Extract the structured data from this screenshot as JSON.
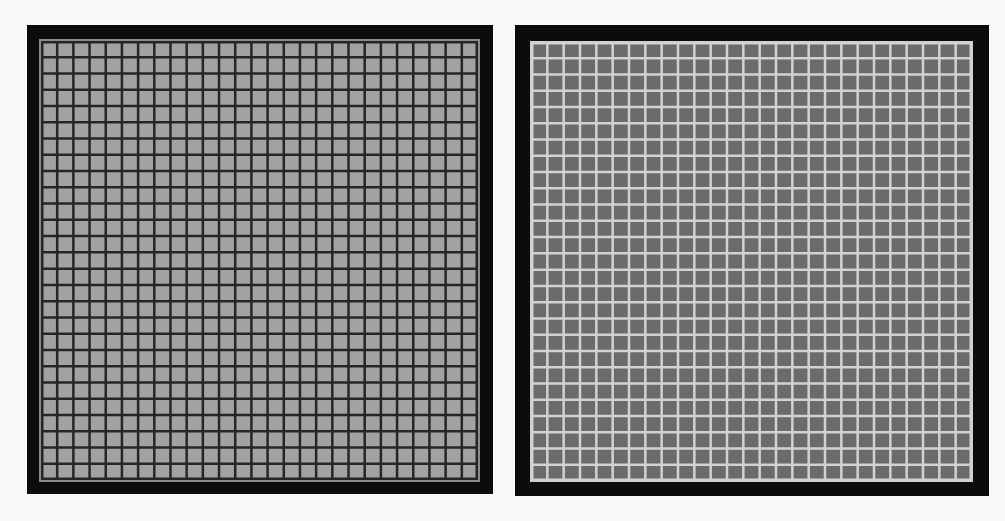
{
  "figure": {
    "panels": [
      {
        "id": "left",
        "description": "Light gray cells separated by dark grid lines",
        "rows": 27,
        "cols": 27,
        "cell_color": "#a2a2a2",
        "line_color": "#262626",
        "frame_color": "#0c0c0c"
      },
      {
        "id": "right",
        "description": "Dark gray cells separated by light grid lines",
        "rows": 27,
        "cols": 27,
        "cell_color": "#6b6b6b",
        "line_color": "#d2d2d2",
        "frame_color": "#0c0c0c"
      }
    ]
  }
}
